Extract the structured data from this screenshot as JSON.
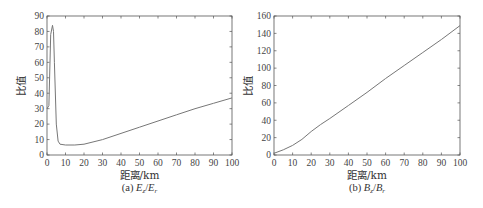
{
  "chart_data": [
    {
      "type": "line",
      "panel": "a",
      "caption_prefix": "(a) ",
      "caption_math": [
        "E",
        "z",
        "/",
        "E",
        "r"
      ],
      "caption": "(a) Ez/Er",
      "xlabel": "距离/km",
      "ylabel": "比值",
      "xlim": [
        0,
        100
      ],
      "ylim": [
        0,
        90
      ],
      "xticks": [
        0,
        10,
        20,
        30,
        40,
        50,
        60,
        70,
        80,
        90,
        100
      ],
      "yticks": [
        0,
        10,
        20,
        30,
        40,
        50,
        60,
        70,
        80,
        90
      ],
      "grid": false,
      "series": [
        {
          "name": "Ez/Er",
          "x": [
            0,
            1,
            2,
            3,
            3.5,
            4,
            5,
            6,
            7,
            10,
            15,
            20,
            30,
            40,
            50,
            60,
            70,
            80,
            90,
            100
          ],
          "y": [
            30,
            32,
            78,
            84,
            80,
            60,
            20,
            9,
            7,
            6.5,
            6.5,
            7,
            10,
            14,
            18,
            22,
            26,
            30,
            33.5,
            37
          ]
        }
      ]
    },
    {
      "type": "line",
      "panel": "b",
      "caption_prefix": "(b) ",
      "caption_math": [
        "B",
        "z",
        "/",
        "B",
        "r"
      ],
      "caption": "(b) Bz/Br",
      "xlabel": "距离/km",
      "ylabel": "比值",
      "xlim": [
        0,
        100
      ],
      "ylim": [
        0,
        160
      ],
      "xticks": [
        0,
        10,
        20,
        30,
        40,
        50,
        60,
        70,
        80,
        90,
        100
      ],
      "yticks": [
        0,
        20,
        40,
        60,
        80,
        100,
        120,
        140,
        160
      ],
      "grid": false,
      "series": [
        {
          "name": "Bz/Br",
          "x": [
            0,
            5,
            10,
            15,
            20,
            25,
            30,
            40,
            50,
            60,
            70,
            80,
            90,
            100
          ],
          "y": [
            2,
            6,
            11,
            18,
            27,
            35,
            42,
            57,
            72,
            88,
            103,
            118,
            133,
            149
          ]
        }
      ]
    }
  ],
  "style": {
    "axis_color": "#555555",
    "line_color": "#777777"
  }
}
